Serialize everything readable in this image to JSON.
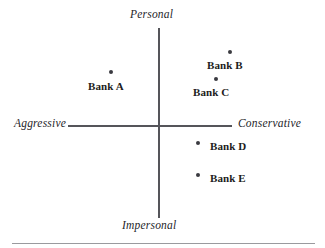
{
  "chart_data": {
    "type": "scatter",
    "title": "",
    "subtitle": "",
    "xlabel": "",
    "ylabel": "",
    "grid": false,
    "legend": "none",
    "axis_style": "crossed-quadrant",
    "xlim": [
      -1,
      1
    ],
    "ylim": [
      -1,
      1
    ],
    "axis_endpoint_labels": {
      "top": "Personal",
      "bottom": "Impersonal",
      "left": "Aggressive",
      "right": "Conservative"
    },
    "categories": [
      "Bank A",
      "Bank B",
      "Bank C",
      "Bank D",
      "Bank E"
    ],
    "points": [
      {
        "label": "Bank A",
        "x": -0.54,
        "y": 0.58,
        "quadrant": "aggressive-personal",
        "label_position": "below"
      },
      {
        "label": "Bank B",
        "x": 0.8,
        "y": 0.79,
        "quadrant": "conservative-personal",
        "label_position": "below"
      },
      {
        "label": "Bank C",
        "x": 0.64,
        "y": 0.51,
        "quadrant": "conservative-personal",
        "label_position": "below"
      },
      {
        "label": "Bank D",
        "x": 0.45,
        "y": -0.18,
        "quadrant": "conservative-impersonal",
        "label_position": "right"
      },
      {
        "label": "Bank E",
        "x": 0.45,
        "y": -0.52,
        "quadrant": "conservative-impersonal",
        "label_position": "right"
      }
    ],
    "colors": {
      "point": "#3a3a40",
      "axis": "#55555a",
      "text": "#1c1c20",
      "rule": "#9a9a9e",
      "background": "#ffffff"
    }
  },
  "axes": {
    "top": "Personal",
    "bottom": "Impersonal",
    "left": "Aggressive",
    "right": "Conservative"
  },
  "points": {
    "a": "Bank A",
    "b": "Bank B",
    "c": "Bank C",
    "d": "Bank D",
    "e": "Bank E"
  }
}
